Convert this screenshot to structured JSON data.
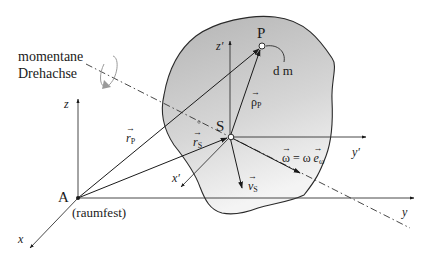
{
  "diagram": {
    "labels": {
      "rotation_axis_line1": "momentane",
      "rotation_axis_line2": "Drehachse",
      "point_P": "P",
      "mass_element": "d m",
      "point_S": "S",
      "point_A": "A",
      "fixed_note": "(raumfest)",
      "axis_x": "x",
      "axis_y": "y",
      "axis_z": "z",
      "axis_x_prime": "x′",
      "axis_y_prime": "y′",
      "axis_z_prime": "z′",
      "vec_r_P": "r",
      "vec_r_P_sub": "P",
      "vec_r_S": "r",
      "vec_r_S_sub": "S",
      "vec_rho_P": "ρ",
      "vec_rho_P_sub": "P",
      "vec_v_S": "v",
      "vec_v_S_sub": "S",
      "omega_eq_left": "ω",
      "omega_eq_mid": " = ω ",
      "omega_eq_e": "e",
      "omega_eq_sub": "ω"
    },
    "colors": {
      "body_fill_top": "#b8b8b8",
      "body_fill_bottom": "#f2f2f2",
      "line": "#2a2a2a",
      "rotation_arrow": "#999999"
    }
  }
}
